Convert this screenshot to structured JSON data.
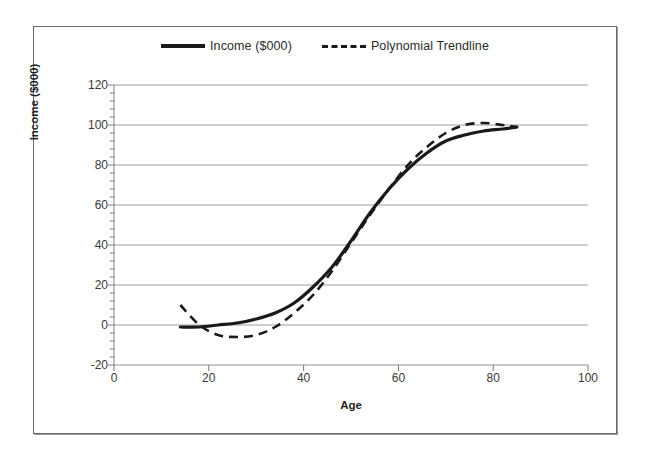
{
  "figure": {
    "background": "#ffffff",
    "border_color": "#6b6b6b"
  },
  "legend": {
    "position": "top-center",
    "entries": [
      {
        "label": "Income ($000)",
        "style": "solid",
        "color": "#1a1a1a",
        "icon": "solid-line-swatch"
      },
      {
        "label": "Polynomial Trendline",
        "style": "dashed",
        "color": "#1a1a1a",
        "icon": "dashed-line-swatch"
      }
    ]
  },
  "axes": {
    "x": {
      "title": "Age",
      "min": 0,
      "max": 100,
      "step": 20,
      "ticks": [
        "0",
        "20",
        "40",
        "60",
        "80",
        "100"
      ]
    },
    "y": {
      "title": "Income ($000)",
      "min": -20,
      "max": 120,
      "step": 20,
      "ticks": [
        "120",
        "100",
        "80",
        "60",
        "40",
        "20",
        "0",
        "-20"
      ],
      "minor_ticks_per_major": 5
    }
  },
  "chart_data": {
    "type": "line",
    "title": "",
    "subtitle": "",
    "xlabel": "Age",
    "ylabel": "Income ($000)",
    "xlim": [
      0,
      100
    ],
    "ylim": [
      -20,
      120
    ],
    "xticks": [
      0,
      20,
      40,
      60,
      80,
      100
    ],
    "yticks": [
      -20,
      0,
      20,
      40,
      60,
      80,
      100,
      120
    ],
    "grid": "horizontal",
    "legend_position": "top-center",
    "x": [
      14,
      18,
      22,
      26,
      30,
      34,
      38,
      42,
      46,
      50,
      54,
      58,
      62,
      66,
      70,
      74,
      78,
      82,
      85
    ],
    "series": [
      {
        "name": "Income ($000)",
        "style": "solid",
        "color": "#1a1a1a",
        "width": 3.2,
        "values": [
          -1,
          -1,
          0,
          1,
          3,
          6,
          11,
          19,
          29,
          42,
          56,
          68,
          78,
          86,
          92,
          95,
          97,
          98,
          99
        ]
      },
      {
        "name": "Polynomial Trendline",
        "style": "dashed",
        "color": "#1a1a1a",
        "width": 2.6,
        "values": [
          10,
          0,
          -5,
          -6,
          -5,
          -1,
          6,
          15,
          27,
          41,
          55,
          68,
          80,
          89,
          96,
          100,
          101,
          100,
          99
        ]
      }
    ]
  }
}
